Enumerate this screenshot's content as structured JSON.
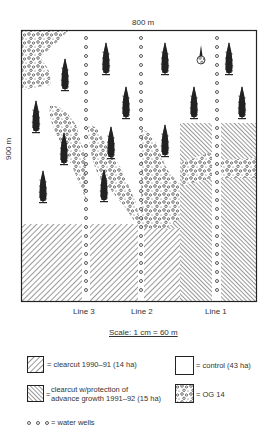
{
  "map": {
    "width_label": "800 m",
    "height_label": "900 m",
    "lines": [
      {
        "label": "Line 3",
        "x": 86
      },
      {
        "label": "Line 2",
        "x": 141
      },
      {
        "label": "Line 1",
        "x": 217
      }
    ],
    "scale": "Scale: 1 cm = 60 m"
  },
  "legend": {
    "clearcut": "= clearcut 1990–91 (14 ha)",
    "control": "= control (43 ha)",
    "advance_line1": "clearcut w/protection of",
    "advance_line2": "advance growth 1991–92 (15 ha)",
    "advance_eq": "=",
    "og": "= OG 14",
    "wells": "= water wells"
  },
  "colors": {
    "ink": "#222222",
    "paper": "#ffffff"
  }
}
